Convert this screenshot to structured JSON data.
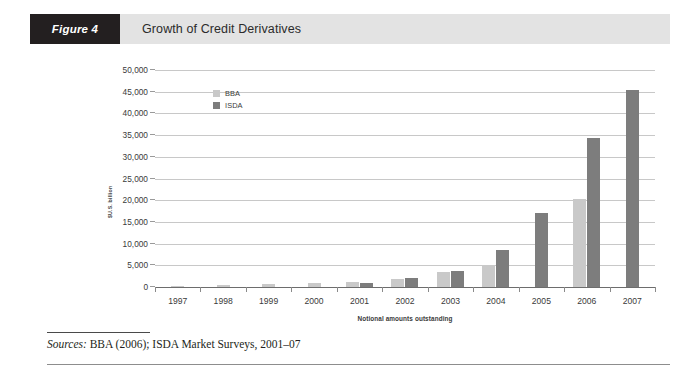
{
  "figure": {
    "tag": "Figure 4",
    "title": "Growth of Credit Derivatives"
  },
  "source": {
    "lead": "Sources:",
    "text": " BBA (2006); ISDA Market Surveys, 2001–07"
  },
  "colors": {
    "bba": "#c9c9c9",
    "isda": "#7d7d7d",
    "header_bar": "#e3e3e3",
    "header_tag": "#231f20",
    "gridline": "#c8c8c8",
    "axis": "#6d6d6d"
  },
  "chart_data": {
    "type": "bar",
    "title": "Growth of Credit Derivatives",
    "xlabel": "Notional amounts outstanding",
    "ylabel": "$U.S. billion",
    "categories": [
      "1997",
      "1998",
      "1999",
      "2000",
      "2001",
      "2002",
      "2003",
      "2004",
      "2005",
      "2006",
      "2007"
    ],
    "ylim": [
      0,
      50000
    ],
    "yticks": [
      0,
      5000,
      10000,
      15000,
      20000,
      25000,
      30000,
      35000,
      40000,
      45000,
      50000
    ],
    "ytick_labels": [
      "0",
      "5,000",
      "10,000",
      "15,000",
      "20,000",
      "25,000",
      "30,000",
      "35,000",
      "40,000",
      "45,000",
      "50,000"
    ],
    "grid": true,
    "legend_position": "upper-left-inside",
    "series": [
      {
        "name": "BBA",
        "color": "#c9c9c9",
        "values": [
          180,
          350,
          586,
          893,
          1189,
          1952,
          3548,
          5021,
          null,
          20207,
          null
        ]
      },
      {
        "name": "ISDA",
        "color": "#7d7d7d",
        "values": [
          null,
          null,
          null,
          null,
          918,
          2192,
          3779,
          8422,
          17096,
          34423,
          45464
        ]
      }
    ]
  }
}
